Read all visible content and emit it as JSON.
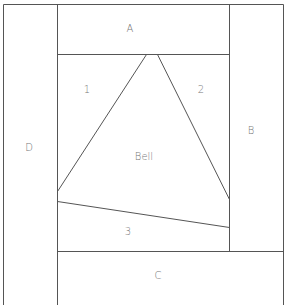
{
  "diagram": {
    "labels": {
      "A": "A",
      "B": "B",
      "C": "C",
      "D": "D",
      "one": "1",
      "two": "2",
      "three": "3",
      "bell": "Bell"
    },
    "line_color": "#555555",
    "text_color": "#777777"
  }
}
